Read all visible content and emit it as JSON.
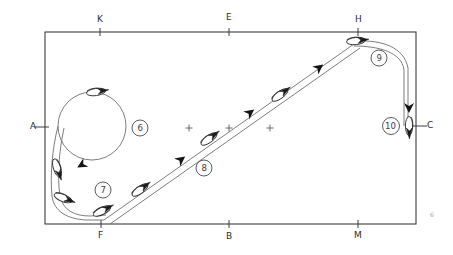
{
  "diagram": {
    "arena": {
      "x": 45,
      "y": 32,
      "width": 371,
      "height": 192,
      "border_color": "#3c3c3c"
    },
    "colors": {
      "ink": "#2b2b2b",
      "line": "#4a4a4a",
      "track": "#6e6e6e",
      "fill": "#ffffff"
    },
    "letter_markers": [
      {
        "name": "marker-A",
        "label": "A",
        "text_x": 30,
        "text_y": 122,
        "tick_x": 45,
        "tick_y": 127,
        "side": "left"
      },
      {
        "name": "marker-K",
        "label": "K",
        "text_x": 97,
        "text_y": 15,
        "tick_x": 100,
        "tick_y": 32,
        "side": "top"
      },
      {
        "name": "marker-E",
        "label": "E",
        "text_x": 226,
        "text_y": 13,
        "tick_x": 229,
        "tick_y": 32,
        "side": "top"
      },
      {
        "name": "marker-H",
        "label": "H",
        "text_x": 355,
        "text_y": 15,
        "tick_x": 358,
        "tick_y": 32,
        "side": "top"
      },
      {
        "name": "marker-C",
        "label": "C",
        "text_x": 427,
        "text_y": 121,
        "tick_x": 416,
        "tick_y": 126,
        "side": "right"
      },
      {
        "name": "marker-M",
        "label": "M",
        "text_x": 354,
        "text_y": 231,
        "tick_x": 358,
        "tick_y": 224,
        "side": "bottom"
      },
      {
        "name": "marker-B",
        "label": "B",
        "text_x": 226,
        "text_y": 232,
        "tick_x": 229,
        "tick_y": 224,
        "side": "bottom"
      },
      {
        "name": "marker-F",
        "label": "F",
        "text_x": 98,
        "text_y": 231,
        "tick_x": 101,
        "tick_y": 224,
        "side": "bottom"
      }
    ],
    "step_labels": [
      {
        "name": "step-6",
        "label": "6",
        "cx": 140,
        "cy": 128,
        "r": 8
      },
      {
        "name": "step-7",
        "label": "7",
        "cx": 103,
        "cy": 190,
        "r": 8
      },
      {
        "name": "step-8",
        "label": "8",
        "cx": 204,
        "cy": 168,
        "r": 8
      },
      {
        "name": "step-9",
        "label": "9",
        "cx": 379,
        "cy": 58,
        "r": 8
      },
      {
        "name": "step-10",
        "label": "10",
        "cx": 391,
        "cy": 126,
        "r": 8.5
      }
    ],
    "center_crosses": [
      {
        "name": "cross-left",
        "x": 189,
        "y": 128
      },
      {
        "name": "cross-center",
        "x": 229,
        "y": 128
      },
      {
        "name": "cross-right",
        "x": 270,
        "y": 128
      }
    ],
    "page_mark": {
      "name": "page-corner-mark",
      "label": "6",
      "x": 430,
      "y": 212
    },
    "volte": {
      "name": "volte-circle",
      "cx": 92,
      "cy": 126,
      "r": 34
    },
    "horses": [
      {
        "name": "horse-volte-top",
        "x": 96,
        "y": 92,
        "angle": -8
      },
      {
        "name": "horse-left-upper",
        "x": 57,
        "y": 168,
        "angle": 72
      },
      {
        "name": "horse-left-lower",
        "x": 63,
        "y": 198,
        "angle": 22
      },
      {
        "name": "horse-f-corner",
        "x": 102,
        "y": 211,
        "angle": -26
      },
      {
        "name": "horse-diag-low",
        "x": 140,
        "y": 190,
        "angle": -36
      },
      {
        "name": "horse-diag-mid",
        "x": 209,
        "y": 139,
        "angle": -36
      },
      {
        "name": "horse-diag-high",
        "x": 280,
        "y": 95,
        "angle": -36
      },
      {
        "name": "horse-at-h",
        "x": 356,
        "y": 41,
        "angle": -6
      },
      {
        "name": "horse-at-c",
        "x": 409,
        "y": 126,
        "angle": 90
      }
    ],
    "arrows": [
      {
        "name": "arrow-volte-bottom",
        "x": 85,
        "y": 163,
        "angle": 150
      },
      {
        "name": "arrow-diag-low",
        "x": 178,
        "y": 162,
        "angle": -37
      },
      {
        "name": "arrow-diag-mid",
        "x": 247,
        "y": 115,
        "angle": -37
      },
      {
        "name": "arrow-diag-high",
        "x": 316,
        "y": 70,
        "angle": -37
      },
      {
        "name": "arrow-right-down",
        "x": 409,
        "y": 104,
        "angle": 90
      }
    ]
  }
}
